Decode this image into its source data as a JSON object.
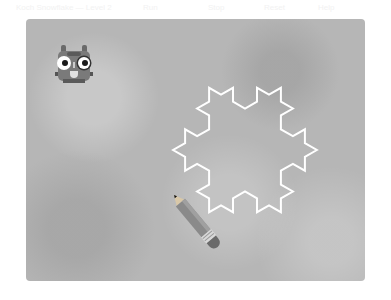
{
  "topbar": {
    "items": [
      "Koch Snowflake — Level 2",
      "Run",
      "Stop",
      "Reset",
      "Help"
    ]
  },
  "stage": {
    "background": "#b6b6b6",
    "snowflake": {
      "center_x": 219,
      "center_y": 131,
      "tip_radius": 83,
      "level": 2,
      "stroke": "#ffffff",
      "stroke_width": 2
    },
    "sprites": {
      "robot": {
        "name": "robot-sprite",
        "x": 27,
        "y": 23
      },
      "pencil": {
        "name": "pencil-sprite",
        "tip_x": 148,
        "tip_y": 176
      }
    }
  }
}
